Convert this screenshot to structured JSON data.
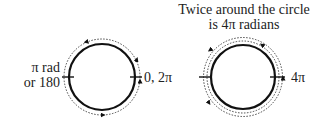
{
  "left_diagram": {
    "label_left_line1": "π rad",
    "label_left_line2": "or 180",
    "label_right": "0, 2π"
  },
  "right_diagram": {
    "title_line1": "Twice around the circle",
    "title_line2": "is 4π radians",
    "label_right": "4π"
  },
  "colors": {
    "stroke": "#111111",
    "text": "#222222"
  }
}
